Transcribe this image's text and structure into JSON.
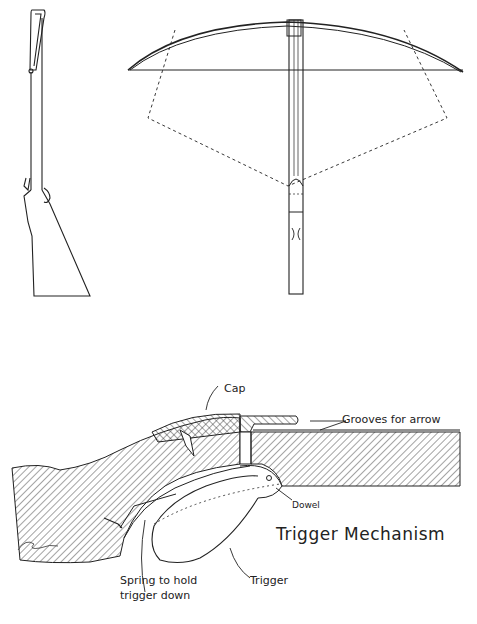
{
  "figure": {
    "title": "Trigger Mechanism",
    "views": [
      "side-view-crossbow",
      "top-view-crossbow",
      "trigger-mechanism-section"
    ],
    "labels": {
      "cap": "Cap",
      "grooves": "Grooves for arrow",
      "dowel": "Dowel",
      "trigger": "Trigger",
      "spring_line1": "Spring to hold",
      "spring_line2": "trigger down",
      "title": "Trigger Mechanism"
    },
    "colors": {
      "ink": "#222222",
      "paper": "#ffffff"
    }
  }
}
